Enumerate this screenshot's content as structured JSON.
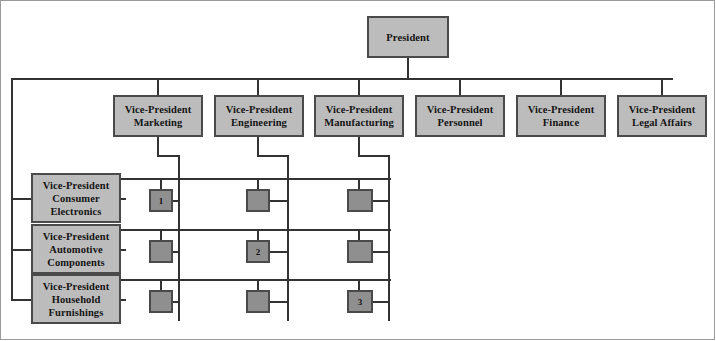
{
  "diagram": {
    "type": "matrix-organization-chart",
    "colors": {
      "box_fill": "#bcbcbc",
      "cell_fill": "#8f8f8f",
      "border": "#4a4a4a",
      "line": "#333333",
      "background": "#ffffff",
      "text": "#151515"
    },
    "top": {
      "label": "President",
      "lines": [
        "President"
      ]
    },
    "functional_vps": [
      {
        "id": "marketing",
        "lines": [
          "Vice-President",
          "Marketing"
        ]
      },
      {
        "id": "engineering",
        "lines": [
          "Vice-President",
          "Engineering"
        ]
      },
      {
        "id": "manufacturing",
        "lines": [
          "Vice-President",
          "Manufacturing"
        ]
      },
      {
        "id": "personnel",
        "lines": [
          "Vice-President",
          "Personnel"
        ]
      },
      {
        "id": "finance",
        "lines": [
          "Vice-President",
          "Finance"
        ]
      },
      {
        "id": "legal-affairs",
        "lines": [
          "Vice-President",
          "Legal Affairs"
        ]
      }
    ],
    "division_vps": [
      {
        "id": "consumer-electronics",
        "lines": [
          "Vice-President",
          "Consumer",
          "Electronics"
        ]
      },
      {
        "id": "automotive-components",
        "lines": [
          "Vice-President",
          "Automotive",
          "Components"
        ]
      },
      {
        "id": "household-furnishings",
        "lines": [
          "Vice-President",
          "Household",
          "Furnishings"
        ]
      }
    ],
    "matrix_cells": [
      {
        "row": "consumer-electronics",
        "column": "marketing",
        "label": "1"
      },
      {
        "row": "consumer-electronics",
        "column": "engineering",
        "label": ""
      },
      {
        "row": "consumer-electronics",
        "column": "manufacturing",
        "label": ""
      },
      {
        "row": "automotive-components",
        "column": "marketing",
        "label": ""
      },
      {
        "row": "automotive-components",
        "column": "engineering",
        "label": "2"
      },
      {
        "row": "automotive-components",
        "column": "manufacturing",
        "label": ""
      },
      {
        "row": "household-furnishings",
        "column": "marketing",
        "label": ""
      },
      {
        "row": "household-furnishings",
        "column": "engineering",
        "label": ""
      },
      {
        "row": "household-furnishings",
        "column": "manufacturing",
        "label": "3"
      }
    ]
  }
}
